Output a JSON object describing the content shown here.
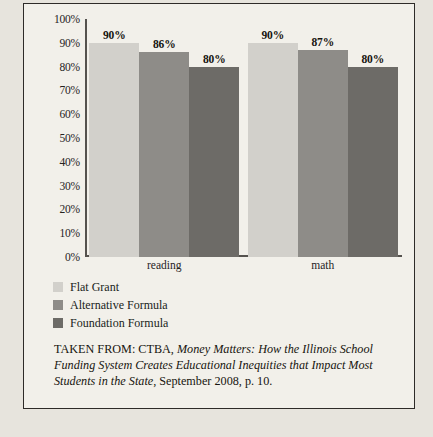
{
  "chart_data": {
    "type": "bar",
    "title": "",
    "subtitle": "",
    "xlabel": "",
    "ylabel": "",
    "categories": [
      "reading",
      "math"
    ],
    "series": [
      {
        "name": "Flat Grant",
        "values": [
          90,
          90
        ],
        "labels": [
          "90%",
          "90%"
        ],
        "color": "#d2d0cb"
      },
      {
        "name": "Alternative Formula",
        "values": [
          86,
          87
        ],
        "labels": [
          "86%",
          "87%"
        ],
        "color": "#8e8c88"
      },
      {
        "name": "Foundation Formula",
        "values": [
          80,
          80
        ],
        "labels": [
          "80%",
          "80%"
        ],
        "color": "#6d6b67"
      }
    ],
    "ylim": [
      0,
      100
    ],
    "ytick_labels": [
      "100%",
      "90%",
      "80%",
      "70%",
      "60%",
      "50%",
      "40%",
      "30%",
      "20%",
      "10%",
      "0%"
    ],
    "ytick_values": [
      100,
      90,
      80,
      70,
      60,
      50,
      40,
      30,
      20,
      10,
      0
    ],
    "grid": false,
    "legend_position": "below-left",
    "value_labels_shown": true
  },
  "legend": {
    "items": [
      {
        "label": "Flat Grant",
        "color": "#d2d0cb"
      },
      {
        "label": "Alternative Formula",
        "color": "#8e8c88"
      },
      {
        "label": "Foundation Formula",
        "color": "#6d6b67"
      }
    ]
  },
  "caption": {
    "prefix": "TAKEN FROM: CTBA, ",
    "title_italic": "Money Matters: How the Illinois School Funding System Creates Educational Inequities that Impact Most Students in the State",
    "suffix": ", September 2008, p. 10."
  }
}
